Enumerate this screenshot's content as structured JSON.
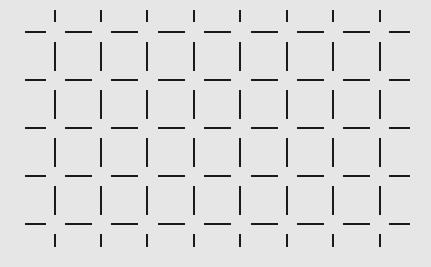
{
  "figure": {
    "background": "#e6e6e6",
    "line_color": "#1a1a1a",
    "horizontal_rows_y": [
      32,
      80,
      128,
      176,
      224
    ],
    "horizontal_segments_x": [
      [
        25,
        46
      ],
      [
        65,
        92
      ],
      [
        111,
        138
      ],
      [
        158,
        185
      ],
      [
        204,
        231
      ],
      [
        251,
        278
      ],
      [
        297,
        324
      ],
      [
        343,
        370
      ],
      [
        389,
        410
      ]
    ],
    "vertical_columns_x": [
      55,
      101,
      147,
      194,
      240,
      287,
      333,
      380
    ],
    "vertical_segments_y": [
      [
        10,
        22
      ],
      [
        42,
        71
      ],
      [
        90,
        119
      ],
      [
        138,
        167
      ],
      [
        186,
        215
      ],
      [
        234,
        247
      ]
    ]
  }
}
